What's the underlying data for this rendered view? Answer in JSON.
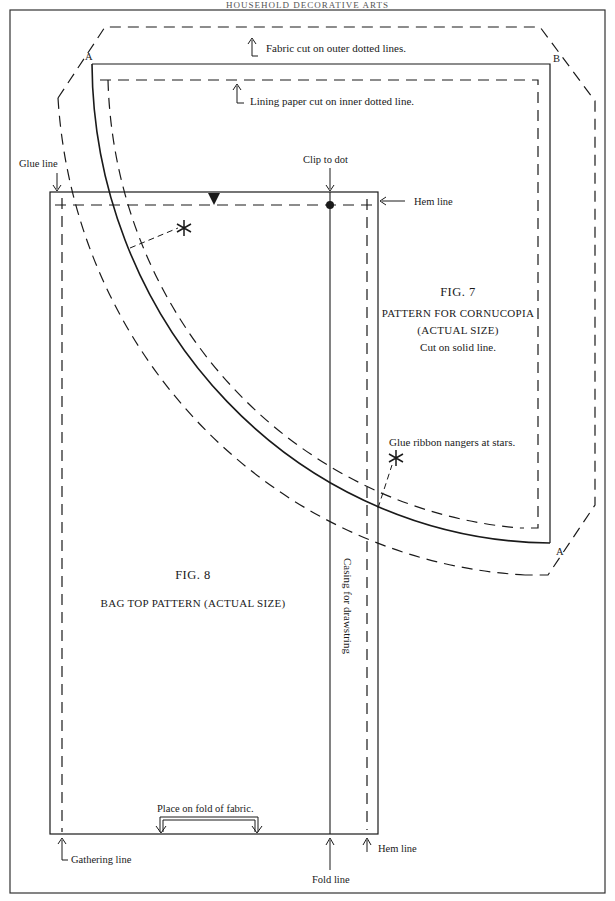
{
  "page": {
    "running_head": "HOUSEHOLD DECORATIVE ARTS"
  },
  "fig7": {
    "number": "FIG. 7",
    "title": "PATTERN FOR CORNUCOPIA",
    "subtitle": "(ACTUAL SIZE)",
    "instruction": "Cut on solid line.",
    "point_a_top": "A",
    "point_b": "B",
    "point_a_bottom": "A",
    "notes": {
      "fabric": "Fabric cut on outer dotted lines.",
      "lining": "Lining paper cut on inner dotted line.",
      "ribbon": "Glue ribbon nangers at stars."
    }
  },
  "fig8": {
    "number": "FIG. 8",
    "title": "BAG TOP PATTERN (ACTUAL SIZE)",
    "labels": {
      "glue_line": "Glue line",
      "clip_to_dot": "Clip to dot",
      "hem_line_top": "Hem line",
      "casing": "Casing for drawstring",
      "place_on_fold": "Place on fold of fabric.",
      "gathering_line": "Gathering line",
      "fold_line": "Fold line",
      "hem_line_bottom": "Hem line"
    }
  },
  "colors": {
    "ink": "#1a1a1a",
    "paper": "#ffffff",
    "frame": "#333333"
  }
}
